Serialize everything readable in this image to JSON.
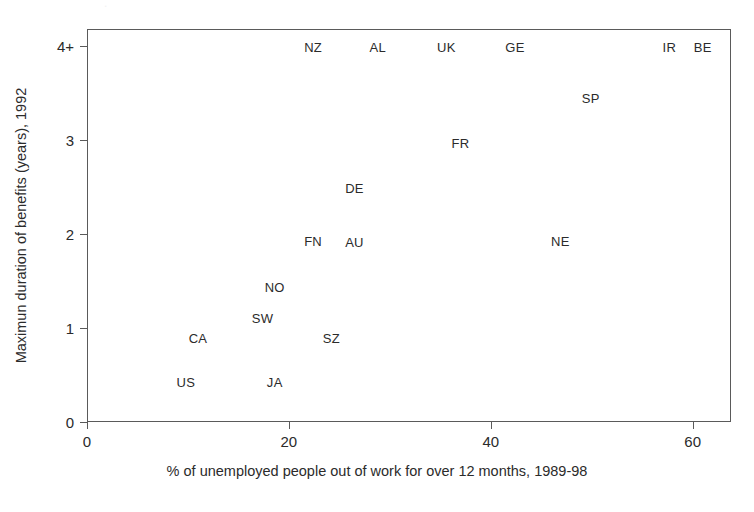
{
  "figure": {
    "background_color": "#ffffff",
    "frame_color": "#5a5a5a",
    "text_color": "#2b2b2b",
    "top_artifact_text": "."
  },
  "chart_data": {
    "type": "scatter",
    "title": "",
    "xlabel": "% of unemployed people out of work for over 12 months, 1989-98",
    "ylabel": "Maximun duration of benefits (years), 1992",
    "xlim": [
      0,
      63.8
    ],
    "ylim": [
      0,
      4.18
    ],
    "xticks": [
      0,
      20,
      40,
      60
    ],
    "xticklabels": [
      "0",
      "20",
      "40",
      "60"
    ],
    "yticks": [
      0,
      1,
      2,
      3,
      4
    ],
    "yticklabels": [
      "0",
      "1",
      "2",
      "3",
      "4+"
    ],
    "grid": false,
    "legend": null,
    "marker_style": "text-label-only",
    "points": [
      {
        "label": "US",
        "x": 9.7,
        "y": 0.44
      },
      {
        "label": "CA",
        "x": 10.9,
        "y": 0.9
      },
      {
        "label": "SW",
        "x": 17.3,
        "y": 1.12
      },
      {
        "label": "JA",
        "x": 18.5,
        "y": 0.44
      },
      {
        "label": "NO",
        "x": 18.5,
        "y": 1.45
      },
      {
        "label": "FN",
        "x": 22.3,
        "y": 1.94
      },
      {
        "label": "SZ",
        "x": 24.1,
        "y": 0.9
      },
      {
        "label": "AU",
        "x": 26.4,
        "y": 1.93
      },
      {
        "label": "DE",
        "x": 26.4,
        "y": 2.5
      },
      {
        "label": "NZ",
        "x": 22.3,
        "y": 4.0
      },
      {
        "label": "AL",
        "x": 28.7,
        "y": 4.0
      },
      {
        "label": "UK",
        "x": 35.5,
        "y": 4.0
      },
      {
        "label": "GE",
        "x": 42.3,
        "y": 4.0
      },
      {
        "label": "FR",
        "x": 36.9,
        "y": 2.98
      },
      {
        "label": "NE",
        "x": 46.8,
        "y": 1.94
      },
      {
        "label": "SP",
        "x": 49.8,
        "y": 3.46
      },
      {
        "label": "IR",
        "x": 57.6,
        "y": 4.0
      },
      {
        "label": "BE",
        "x": 60.9,
        "y": 4.0
      }
    ]
  }
}
